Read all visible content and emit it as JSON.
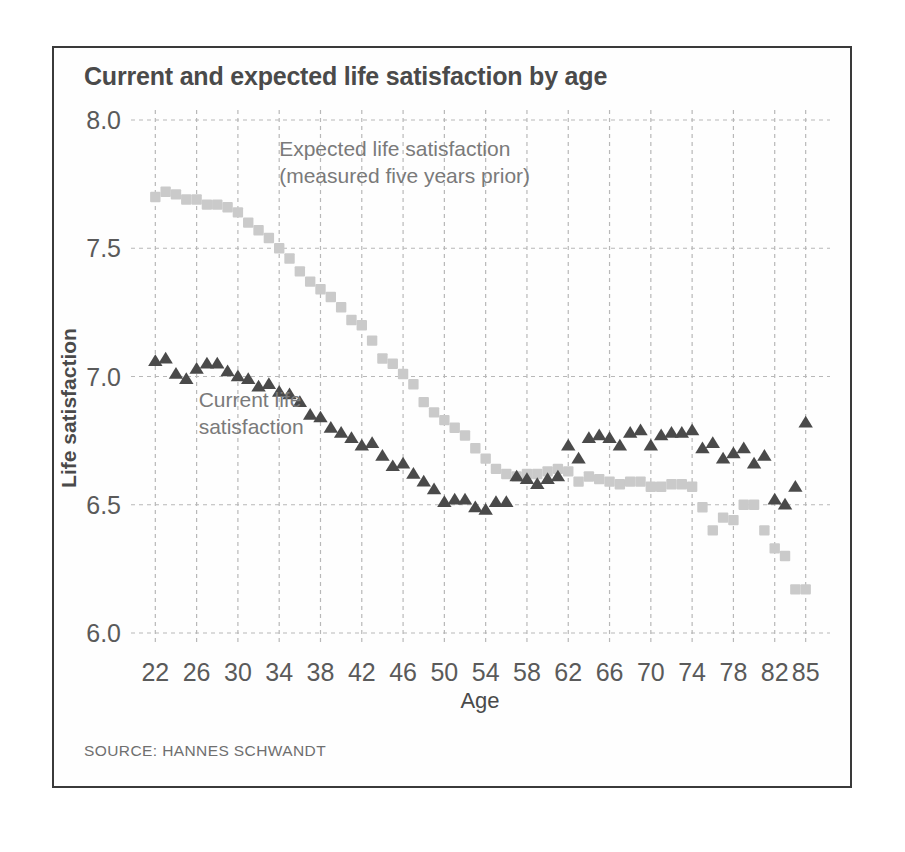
{
  "figure": {
    "title": "Current and expected life satisfaction by age",
    "source": "SOURCE: HANNES SCHWANDT",
    "frame_color": "#3a3a3a",
    "background": "#ffffff"
  },
  "chart_data": {
    "type": "scatter",
    "title": "Current and expected life satisfaction by age",
    "xlabel": "Age",
    "ylabel": "Life satisfaction",
    "xlim": [
      21,
      86
    ],
    "ylim": [
      6.0,
      8.0
    ],
    "grid": true,
    "legend_position": "inline-annotations",
    "xticks": [
      22,
      26,
      30,
      34,
      38,
      42,
      46,
      50,
      54,
      58,
      62,
      66,
      70,
      74,
      78,
      82,
      85
    ],
    "xtick_labels": [
      "22",
      "26",
      "30",
      "34",
      "38",
      "42",
      "46",
      "50",
      "54",
      "58",
      "62",
      "66",
      "70",
      "74",
      "78",
      "82",
      "85"
    ],
    "yticks": [
      6.0,
      6.5,
      7.0,
      7.5,
      8.0
    ],
    "ytick_labels": [
      "6.0",
      "6.5",
      "7.0",
      "7.5",
      "8.0"
    ],
    "annotations": [
      {
        "id": "expected-annotation",
        "lines": [
          "Expected life satisfaction",
          "(measured five years prior)"
        ],
        "x": 34,
        "y": 7.86,
        "color": "#7a7a7a"
      },
      {
        "id": "current-annotation",
        "lines": [
          "Current life",
          "satisfaction"
        ],
        "x": 26.2,
        "y": 6.88,
        "color": "#7a7a7a"
      }
    ],
    "series": [
      {
        "name": "Current life satisfaction",
        "marker": "triangle",
        "color": "#4a4a4a",
        "x": [
          22,
          23,
          24,
          25,
          26,
          27,
          28,
          29,
          30,
          31,
          32,
          33,
          34,
          35,
          36,
          37,
          38,
          39,
          40,
          41,
          42,
          43,
          44,
          45,
          46,
          47,
          48,
          49,
          50,
          51,
          52,
          53,
          54,
          55,
          56,
          57,
          58,
          59,
          60,
          61,
          62,
          63,
          64,
          65,
          66,
          67,
          68,
          69,
          70,
          71,
          72,
          73,
          74,
          75,
          76,
          77,
          78,
          79,
          80,
          81,
          82,
          83,
          84,
          85
        ],
        "values": [
          7.06,
          7.07,
          7.01,
          6.99,
          7.03,
          7.05,
          7.05,
          7.02,
          7.0,
          6.99,
          6.96,
          6.97,
          6.94,
          6.93,
          6.9,
          6.85,
          6.84,
          6.8,
          6.78,
          6.76,
          6.73,
          6.74,
          6.69,
          6.65,
          6.66,
          6.62,
          6.59,
          6.56,
          6.51,
          6.52,
          6.52,
          6.49,
          6.48,
          6.51,
          6.51,
          6.61,
          6.6,
          6.58,
          6.6,
          6.61,
          6.73,
          6.68,
          6.76,
          6.77,
          6.76,
          6.73,
          6.78,
          6.79,
          6.73,
          6.77,
          6.78,
          6.78,
          6.79,
          6.72,
          6.74,
          6.68,
          6.7,
          6.72,
          6.66,
          6.69,
          6.52,
          6.5,
          6.57,
          6.82
        ]
      },
      {
        "name": "Expected life satisfaction (measured five years prior)",
        "marker": "square",
        "color": "#cacaca",
        "x": [
          22,
          23,
          24,
          25,
          26,
          27,
          28,
          29,
          30,
          31,
          32,
          33,
          34,
          35,
          36,
          37,
          38,
          39,
          40,
          41,
          42,
          43,
          44,
          45,
          46,
          47,
          48,
          49,
          50,
          51,
          52,
          53,
          54,
          55,
          56,
          57,
          58,
          59,
          60,
          61,
          62,
          63,
          64,
          65,
          66,
          67,
          68,
          69,
          70,
          71,
          72,
          73,
          74,
          75,
          76,
          77,
          78,
          79,
          80,
          81,
          82,
          83,
          84,
          85
        ],
        "values": [
          7.7,
          7.72,
          7.71,
          7.69,
          7.69,
          7.67,
          7.67,
          7.66,
          7.64,
          7.6,
          7.57,
          7.54,
          7.5,
          7.46,
          7.41,
          7.37,
          7.34,
          7.31,
          7.27,
          7.22,
          7.2,
          7.14,
          7.07,
          7.05,
          7.01,
          6.97,
          6.9,
          6.86,
          6.83,
          6.8,
          6.77,
          6.72,
          6.68,
          6.64,
          6.62,
          6.61,
          6.62,
          6.62,
          6.63,
          6.64,
          6.63,
          6.59,
          6.61,
          6.6,
          6.59,
          6.58,
          6.59,
          6.59,
          6.57,
          6.57,
          6.58,
          6.58,
          6.57,
          6.49,
          6.4,
          6.45,
          6.44,
          6.5,
          6.5,
          6.4,
          6.33,
          6.3,
          6.17,
          6.17
        ]
      }
    ]
  }
}
